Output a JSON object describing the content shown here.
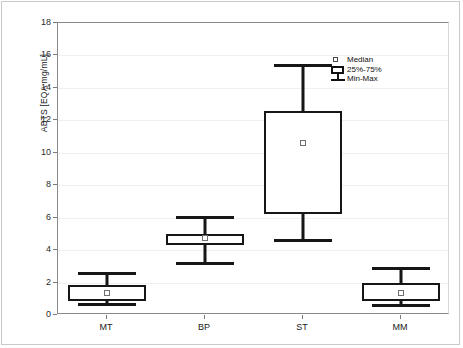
{
  "chart_data": {
    "type": "box",
    "title": "",
    "xlabel": "",
    "ylabel": "ABTS [EQA mg/mL]",
    "categories": [
      "MT",
      "BP",
      "ST",
      "MM"
    ],
    "ylim": [
      0,
      18
    ],
    "yticks": [
      0,
      2,
      4,
      6,
      8,
      10,
      12,
      14,
      16,
      18
    ],
    "ytick_labels": [
      "0",
      "2",
      "4",
      "6",
      "8",
      "10",
      "12",
      "14",
      "16",
      "18"
    ],
    "grid": true,
    "legend_position": "top-right",
    "legend": [
      {
        "label": "Median",
        "glyph": "open-square-marker"
      },
      {
        "label": "25%-75%",
        "glyph": "box-outline"
      },
      {
        "label": "Min-Max",
        "glyph": "whisker-bars"
      }
    ],
    "boxes": [
      {
        "category": "MT",
        "min": 0.65,
        "q1": 0.85,
        "median": 1.35,
        "q3": 1.85,
        "max": 2.6
      },
      {
        "category": "BP",
        "min": 3.2,
        "q1": 4.3,
        "median": 4.75,
        "q3": 5.0,
        "max": 6.05
      },
      {
        "category": "ST",
        "min": 4.6,
        "q1": 6.2,
        "median": 10.6,
        "q3": 12.6,
        "max": 15.4
      },
      {
        "category": "MM",
        "min": 0.6,
        "q1": 0.85,
        "median": 1.35,
        "q3": 1.95,
        "max": 2.9
      }
    ]
  },
  "axes": {
    "y_label": "ABTS [EQA mg/mL]"
  },
  "colors": {
    "box_stroke": "#161616",
    "grid": "#f0f0f0",
    "axis": "#8a8a8a",
    "text": "#1a1a1a",
    "background": "#ffffff"
  }
}
